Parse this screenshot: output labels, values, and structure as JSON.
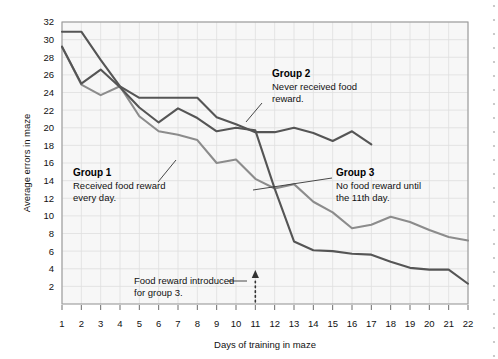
{
  "chart_data": {
    "type": "line",
    "title": "",
    "xlabel": "Days of training in maze",
    "ylabel": "Average errors in maze",
    "xlim": [
      1,
      22
    ],
    "ylim": [
      0,
      32
    ],
    "yticks": [
      2,
      4,
      6,
      8,
      10,
      12,
      14,
      16,
      18,
      20,
      22,
      24,
      26,
      28,
      30,
      32
    ],
    "xticks": [
      1,
      2,
      3,
      4,
      5,
      6,
      7,
      8,
      9,
      10,
      11,
      12,
      13,
      14,
      15,
      16,
      17,
      18,
      19,
      20,
      21,
      22
    ],
    "grid": true,
    "legend_position": "inline-annotations",
    "series": [
      {
        "name": "Group 1",
        "color": "#8c8c8c",
        "x": [
          1,
          2,
          3,
          4,
          5,
          6,
          7,
          8,
          9,
          10,
          11,
          12,
          13,
          14,
          15,
          16,
          17,
          18,
          19,
          20,
          21,
          22
        ],
        "values": [
          29.2,
          24.9,
          23.7,
          24.7,
          21.3,
          19.6,
          19.2,
          18.6,
          16.0,
          16.4,
          14.2,
          13.1,
          13.6,
          11.6,
          10.4,
          8.6,
          9.0,
          9.9,
          9.3,
          8.4,
          7.6,
          7.2
        ]
      },
      {
        "name": "Group 2",
        "color": "#555555",
        "x": [
          1,
          2,
          3,
          4,
          5,
          6,
          7,
          8,
          9,
          10,
          11,
          12,
          13,
          14,
          15,
          16,
          17
        ],
        "values": [
          30.9,
          30.9,
          27.7,
          24.7,
          23.4,
          23.4,
          23.4,
          23.4,
          21.2,
          20.4,
          19.5,
          19.5,
          20.0,
          19.4,
          18.5,
          19.6,
          18.1
        ]
      },
      {
        "name": "Group 3",
        "color": "#555555",
        "x": [
          1,
          2,
          3,
          4,
          5,
          6,
          7,
          8,
          9,
          10,
          11,
          12,
          13,
          14,
          15,
          16,
          17,
          18,
          19,
          20,
          21,
          22
        ],
        "values": [
          29.2,
          25.0,
          26.6,
          24.6,
          22.3,
          20.6,
          22.2,
          21.1,
          19.6,
          20.0,
          19.7,
          13.1,
          7.1,
          6.1,
          6.0,
          5.7,
          5.6,
          4.8,
          4.1,
          3.9,
          3.9,
          2.3
        ]
      }
    ],
    "annotations": [
      {
        "id": "group1",
        "title": "Group 1",
        "lines": [
          "Received food reward",
          "every day."
        ]
      },
      {
        "id": "group2",
        "title": "Group 2",
        "lines": [
          "Never received food",
          "reward."
        ]
      },
      {
        "id": "group3",
        "title": "Group 3",
        "lines": [
          "No food reward until",
          "the 11th day."
        ]
      },
      {
        "id": "food-reward-marker",
        "title": "",
        "lines": [
          "Food reward introduced",
          "for group 3."
        ]
      }
    ],
    "marker_line": {
      "x": 11,
      "style": "dotted",
      "arrow": "up"
    },
    "colors": {
      "grid": "#d9d9d9",
      "plot_background": "#f7f7f7",
      "axis": "#6e6e6e",
      "group1_line": "#8c8c8c",
      "group2_line": "#555555",
      "group3_line": "#555555"
    }
  }
}
